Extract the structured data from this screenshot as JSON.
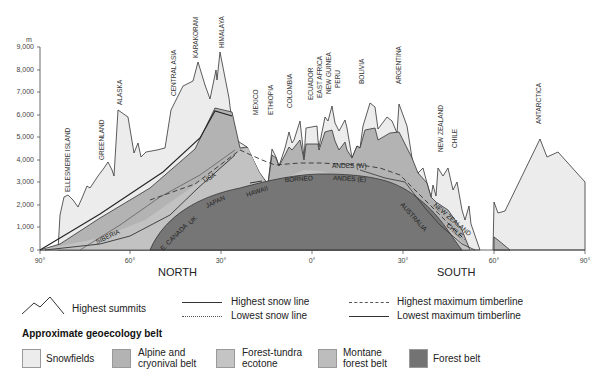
{
  "y_axis": {
    "unit": "m",
    "ticks": [
      "9,000",
      "8,000",
      "7,000",
      "6,000",
      "5,000",
      "4,000",
      "3,000",
      "2,000",
      "1,000",
      "0"
    ]
  },
  "x_axis": {
    "ticks": [
      "90°",
      "60°",
      "30°",
      "0°",
      "30°",
      "60°",
      "90°"
    ],
    "north_label": "NORTH",
    "south_label": "SOUTH"
  },
  "region_labels": {
    "ellesmere": "ELLESMERE ISLAND",
    "greenland": "GREENLAND",
    "alaska": "ALASKA",
    "central_asia": "CENTRAL ASIA",
    "karakoram": "KARAKORAM",
    "himalaya": "HIMALAYA",
    "mexico": "MEXICO",
    "ethiopia": "ETHIOPIA",
    "colombia": "COLOMBIA",
    "ecuador": "ECUADOR",
    "east_africa": "EAST AFRICA",
    "new_guinea": "NEW GUINEA",
    "peru": "PERU",
    "bolivia": "BOLIVIA",
    "argentina": "ARGENTINA",
    "new_zealand": "NEW ZEALAND",
    "chile": "CHILE",
    "antarctica": "ANTARCTICA"
  },
  "inner_labels": {
    "usa": "USA",
    "siberia": "SIBERIA",
    "e_canada": "E. CANADA",
    "uk": "UK",
    "japan": "JAPAN",
    "hawaii": "HAWAII",
    "borneo": "BORNEO",
    "andes_w": "ANDES (W)",
    "andes_e": "ANDES (E)",
    "australia": "AUSTRALIA",
    "new_zealand": "NEW ZEALAND",
    "chile": "CHILE"
  },
  "legend": {
    "highest_summits": "Highest summits",
    "highest_snow_line": "Highest snow line",
    "lowest_snow_line": "Lowest snow line",
    "highest_max_timberline": "Highest maximum timberline",
    "lowest_max_timberline": "Lowest maximum timberline",
    "belt_title": "Approximate geoecology belt",
    "belts": [
      {
        "label_1": "Snowfields",
        "label_2": "",
        "color": "#ececec"
      },
      {
        "label_1": "Alpine and",
        "label_2": "cryonival belt",
        "color": "#b3b3b3"
      },
      {
        "label_1": "Forest-tundra",
        "label_2": "ecotone",
        "color": "#c4c4c4"
      },
      {
        "label_1": "Montane",
        "label_2": "forest belt",
        "color": "#bdbdbd"
      },
      {
        "label_1": "Forest belt",
        "label_2": "",
        "color": "#737373"
      }
    ]
  },
  "colors": {
    "snowfields": "#ececec",
    "alpine": "#b0b0b0",
    "montane": "#c2c2c2",
    "forest": "#767676",
    "outline": "#333333"
  }
}
